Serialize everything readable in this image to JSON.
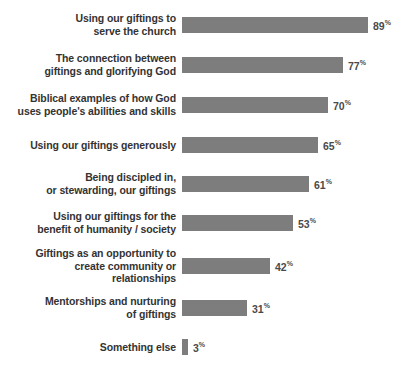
{
  "chart_data": {
    "type": "bar",
    "orientation": "horizontal",
    "title": "",
    "subtitle": "",
    "xlabel": "",
    "ylabel": "",
    "xlim": [
      0,
      100
    ],
    "grid": false,
    "legend": false,
    "value_suffix": "%",
    "categories": [
      "Using our giftings to serve the church",
      "The connection between giftings and glorifying God",
      "Biblical examples of how God uses people's abilities and skills",
      "Using our giftings generously",
      "Being discipled in, or stewarding, our giftings",
      "Using our giftings for the benefit of humanity / society",
      "Giftings as an opportunity to create community or relationships",
      "Mentorships and nurturing of giftings",
      "Something else"
    ],
    "values": [
      89,
      77,
      70,
      65,
      61,
      53,
      42,
      31,
      3
    ],
    "bar_color": "#7d7d7d",
    "label_color": "#333333",
    "value_color": "#4a4a4a",
    "background": "#ffffff"
  },
  "bars": [
    {
      "lines": [
        "Using our giftings to",
        "serve the church"
      ],
      "value": "89",
      "pct": "%",
      "value_num": 89,
      "top": 25
    },
    {
      "lines": [
        "The connection between",
        "giftings and glorifying God"
      ],
      "value": "77",
      "pct": "%",
      "value_num": 77,
      "top": 65
    },
    {
      "lines": [
        "Biblical examples of how God",
        "uses people's abilities and skills"
      ],
      "value": "70",
      "pct": "%",
      "value_num": 70,
      "top": 105
    },
    {
      "lines": [
        "Using our giftings generously"
      ],
      "value": "65",
      "pct": "%",
      "value_num": 65,
      "top": 145
    },
    {
      "lines": [
        "Being discipled in,",
        "or stewarding, our giftings"
      ],
      "value": "61",
      "pct": "%",
      "value_num": 61,
      "top": 184
    },
    {
      "lines": [
        "Using our giftings for the",
        "benefit of humanity / society"
      ],
      "value": "53",
      "pct": "%",
      "value_num": 53,
      "top": 223
    },
    {
      "lines": [
        "Giftings as an opportunity to",
        "create community or",
        "relationships"
      ],
      "value": "42",
      "pct": "%",
      "value_num": 42,
      "top": 266
    },
    {
      "lines": [
        "Mentorships and nurturing",
        "of giftings"
      ],
      "value": "31",
      "pct": "%",
      "value_num": 31,
      "top": 308
    },
    {
      "lines": [
        "Something else"
      ],
      "value": "3",
      "pct": "%",
      "value_num": 3,
      "top": 347
    }
  ],
  "scale": {
    "px_per_percent": 2.09
  }
}
